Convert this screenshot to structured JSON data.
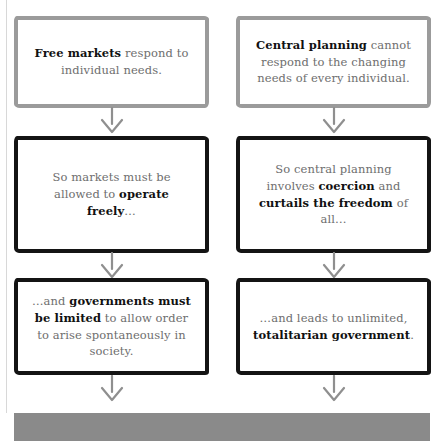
{
  "diagram": {
    "columns": [
      {
        "id": "free-markets",
        "name": "Free markets column",
        "steps": [
          {
            "id": "free-markets-respond",
            "border_style": "light",
            "border_color": "#9b9b9b",
            "text_html": "<b>Free markets</b> respond to individual needs."
          },
          {
            "id": "markets-operate-freely",
            "border_style": "dark",
            "border_color": "#141414",
            "text_html": "So markets must be allowed to <b>operate freely</b>…"
          },
          {
            "id": "governments-must-be-limited",
            "border_style": "dark",
            "border_color": "#141414",
            "text_html": "…and <b>governments must be limited</b> to allow order to arise spontaneously in society."
          }
        ]
      },
      {
        "id": "central-planning",
        "name": "Central planning column",
        "steps": [
          {
            "id": "central-planning-cannot-respond",
            "border_style": "light",
            "border_color": "#9b9b9b",
            "text_html": "<b>Central planning</b> cannot respond to the changing needs of every individual."
          },
          {
            "id": "central-planning-coercion",
            "border_style": "dark",
            "border_color": "#141414",
            "text_html": "So central planning involves <b>coercion</b> and <b>curtails the freedom</b> of all…"
          },
          {
            "id": "totalitarian-government",
            "border_style": "dark",
            "border_color": "#141414",
            "text_html": "…and leads to unlimited, <b>totalitarian government</b>."
          }
        ]
      }
    ],
    "arrows": {
      "icon": "arrow-down-icon",
      "color": "#8f8f8f",
      "count_per_column": 3
    },
    "bottom_bar": {
      "name": "bottom-bar",
      "color": "#8a8a8a",
      "text": ""
    },
    "gutter_rule": {
      "color": "#d8d8d8"
    }
  }
}
